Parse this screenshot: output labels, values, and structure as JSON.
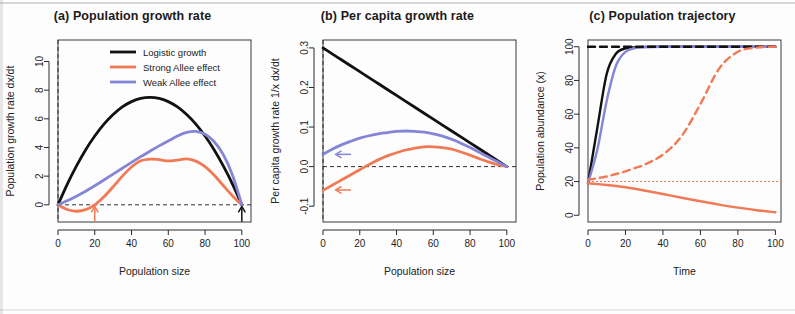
{
  "figure": {
    "background": "#fdfdfd",
    "colors": {
      "logistic": "#111111",
      "strong_allee": "#ef7a55",
      "weak_allee": "#8585d6",
      "axis": "#2a2a2a",
      "dashed_reference": "#2f2f2f"
    }
  },
  "chart_data": [
    {
      "type": "line",
      "panel": "a",
      "title": "(a) Population growth rate",
      "xlabel": "Population size",
      "ylabel": "Population growth rate dx/dt",
      "xlim": [
        0,
        105
      ],
      "ylim": [
        -1.2,
        11.5
      ],
      "xticks": [
        0,
        20,
        40,
        60,
        80,
        100
      ],
      "yticks": [
        0,
        2,
        4,
        6,
        8,
        10
      ],
      "grid": false,
      "legend_position": "top-center",
      "legend": [
        {
          "label": "Logistic growth",
          "color": "#111111"
        },
        {
          "label": "Strong Allee effect",
          "color": "#ef7a55"
        },
        {
          "label": "Weak Allee effect",
          "color": "#8585d6"
        }
      ],
      "annotations": [
        {
          "name": "allee-threshold-arrow",
          "x": 20,
          "y": 0,
          "direction": "up",
          "color": "#ef7a55"
        },
        {
          "name": "carrying-capacity-arrow",
          "x": 100,
          "y": 0,
          "direction": "up",
          "color": "#111111"
        }
      ],
      "reference_lines": [
        {
          "name": "zero-growth-line",
          "orientation": "horizontal",
          "value": 0,
          "style": "dashed"
        },
        {
          "name": "zero-population-line",
          "orientation": "vertical",
          "value": 0,
          "style": "dashed"
        }
      ],
      "x": [
        0,
        5,
        10,
        15,
        20,
        25,
        30,
        35,
        40,
        45,
        50,
        55,
        60,
        65,
        70,
        75,
        80,
        85,
        90,
        95,
        100
      ],
      "series": [
        {
          "name": "Logistic growth",
          "color": "#111111",
          "values": [
            0,
            1.43,
            2.7,
            3.83,
            4.8,
            5.63,
            6.3,
            6.83,
            7.2,
            7.43,
            7.5,
            7.43,
            7.2,
            6.83,
            6.3,
            5.63,
            4.8,
            3.83,
            2.7,
            1.43,
            0
          ]
        },
        {
          "name": "Strong Allee effect",
          "color": "#ef7a55",
          "values": [
            0,
            -0.33,
            -0.45,
            -0.34,
            0.0,
            0.56,
            1.26,
            2.0,
            2.64,
            3.07,
            3.19,
            3.15,
            3.06,
            3.12,
            3.2,
            3.05,
            2.66,
            2.06,
            1.33,
            0.62,
            0
          ]
        },
        {
          "name": "Weak Allee effect",
          "color": "#8585d6",
          "values": [
            0,
            0.28,
            0.6,
            0.95,
            1.33,
            1.73,
            2.14,
            2.55,
            2.96,
            3.36,
            3.74,
            4.11,
            4.45,
            4.8,
            5.05,
            5.12,
            4.92,
            4.4,
            3.48,
            2.05,
            0
          ]
        }
      ]
    },
    {
      "type": "line",
      "panel": "b",
      "title": "(b) Per capita growth rate",
      "xlabel": "Population size",
      "ylabel": "Per capita growth rate 1/x dx/dt",
      "xlim": [
        0,
        105
      ],
      "ylim": [
        -0.14,
        0.32
      ],
      "xticks": [
        0,
        20,
        40,
        60,
        80,
        100
      ],
      "yticks": [
        -0.1,
        0.0,
        0.1,
        0.2,
        0.3
      ],
      "ytick_labels": [
        "-0.1",
        "0.0",
        "0.1",
        "0.2",
        "0.3"
      ],
      "grid": false,
      "annotations": [
        {
          "name": "weak-allee-intercept-arrow",
          "x": 6,
          "y": 0.031,
          "direction": "left",
          "color": "#8585d6"
        },
        {
          "name": "strong-allee-intercept-arrow",
          "x": 6,
          "y": -0.059,
          "direction": "left",
          "color": "#ef7a55"
        }
      ],
      "reference_lines": [
        {
          "name": "zero-per-capita-line",
          "orientation": "horizontal",
          "value": 0,
          "style": "dashed"
        },
        {
          "name": "zero-population-line",
          "orientation": "vertical",
          "value": 0,
          "style": "dashed"
        }
      ],
      "x": [
        0,
        5,
        10,
        15,
        20,
        25,
        30,
        35,
        40,
        45,
        50,
        55,
        60,
        65,
        70,
        75,
        80,
        85,
        90,
        95,
        100
      ],
      "series": [
        {
          "name": "Logistic growth",
          "color": "#111111",
          "values": [
            0.3,
            0.285,
            0.27,
            0.255,
            0.24,
            0.225,
            0.21,
            0.195,
            0.18,
            0.165,
            0.15,
            0.135,
            0.12,
            0.105,
            0.09,
            0.075,
            0.06,
            0.045,
            0.03,
            0.015,
            0.0
          ]
        },
        {
          "name": "Strong Allee effect",
          "color": "#ef7a55",
          "values": [
            -0.06,
            -0.047,
            -0.034,
            -0.021,
            -0.008,
            0.005,
            0.017,
            0.027,
            0.035,
            0.042,
            0.047,
            0.05,
            0.05,
            0.048,
            0.044,
            0.037,
            0.029,
            0.02,
            0.012,
            0.005,
            0.0
          ]
        },
        {
          "name": "Weak Allee effect",
          "color": "#8585d6",
          "values": [
            0.031,
            0.044,
            0.055,
            0.064,
            0.072,
            0.078,
            0.083,
            0.086,
            0.089,
            0.09,
            0.089,
            0.087,
            0.083,
            0.077,
            0.069,
            0.059,
            0.048,
            0.036,
            0.024,
            0.012,
            0.0
          ]
        }
      ]
    },
    {
      "type": "line",
      "panel": "c",
      "title": "(c) Population trajectory",
      "xlabel": "Time",
      "ylabel": "Population abundance (x)",
      "xlim": [
        0,
        103
      ],
      "ylim": [
        -4,
        104
      ],
      "xticks": [
        0,
        20,
        40,
        60,
        80,
        100
      ],
      "yticks": [
        0,
        20,
        40,
        60,
        80,
        100
      ],
      "grid": false,
      "reference_lines": [
        {
          "name": "allee-threshold-line",
          "orientation": "horizontal",
          "value": 20,
          "style": "dotted",
          "color": "#ef7a55"
        }
      ],
      "x": [
        0,
        5,
        10,
        15,
        20,
        25,
        30,
        40,
        50,
        60,
        70,
        80,
        90,
        100
      ],
      "series": [
        {
          "name": "Logistic growth",
          "color": "#111111",
          "style": "solid",
          "values": [
            19,
            52,
            84,
            96,
            99,
            99.6,
            99.9,
            100,
            100,
            100,
            100,
            100,
            100,
            100
          ]
        },
        {
          "name": "Weak Allee effect",
          "color": "#8585d6",
          "style": "solid",
          "values": [
            19,
            39,
            68,
            89,
            97,
            99.2,
            99.7,
            100,
            100,
            100,
            100,
            100,
            100,
            100
          ]
        },
        {
          "name": "Logistic growth high start",
          "color": "#111111",
          "style": "dashed",
          "values": [
            100,
            100,
            100,
            100,
            100,
            100,
            100,
            100,
            100,
            100,
            100,
            100,
            100,
            100
          ]
        },
        {
          "name": "Strong Allee effect above threshold",
          "color": "#ef7a55",
          "style": "dashed",
          "values": [
            21,
            22,
            23,
            24.5,
            26,
            28,
            30,
            36,
            47,
            66,
            87,
            97,
            99.5,
            100
          ]
        },
        {
          "name": "Strong Allee effect below threshold",
          "color": "#ef7a55",
          "style": "solid",
          "values": [
            19,
            18.5,
            18,
            17.4,
            16.6,
            15.7,
            14.7,
            12.6,
            10.4,
            8.3,
            6.3,
            4.5,
            3.0,
            1.8
          ]
        }
      ]
    }
  ]
}
